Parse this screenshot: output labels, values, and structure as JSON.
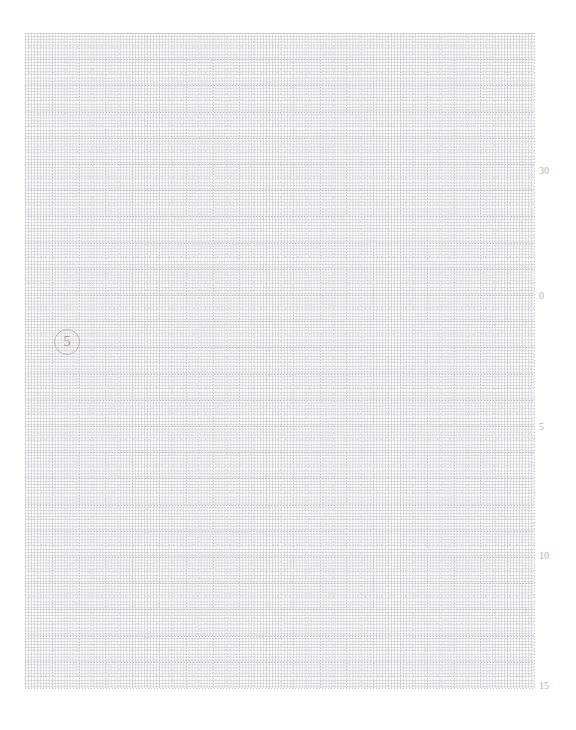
{
  "page": {
    "width": 576,
    "height": 730,
    "background_color": "#ffffff",
    "kind": "graph-paper-sheet"
  },
  "grid": {
    "line_color": "#c6c6cc",
    "minor_line_color": "#dcdce1",
    "style": "dotted",
    "columns": 19,
    "rows": 25,
    "cell_width": 26.79,
    "cell_height": 26.2,
    "left": 25,
    "top": 33,
    "width": 509,
    "height": 655
  },
  "marker": {
    "label": "5",
    "shape": "circle",
    "color": "#9b9ba2",
    "border_color": "#b9b9c0",
    "x": 29,
    "y": 296,
    "size": 26
  },
  "axis": {
    "position": "right",
    "label_color": "#b0b0b7",
    "labels": [
      {
        "text": "30",
        "y": 166
      },
      {
        "text": "0",
        "y": 291
      },
      {
        "text": "5",
        "y": 422
      },
      {
        "text": "10",
        "y": 551
      },
      {
        "text": "15",
        "y": 681
      }
    ]
  },
  "chart_data": {
    "type": "table",
    "title": "",
    "xlabel": "",
    "ylabel": "",
    "grid": true,
    "legend": "none",
    "annotations": [
      "5"
    ],
    "tick_labels": [
      "30",
      "0",
      "5",
      "10",
      "15"
    ],
    "categories": [],
    "values": []
  }
}
